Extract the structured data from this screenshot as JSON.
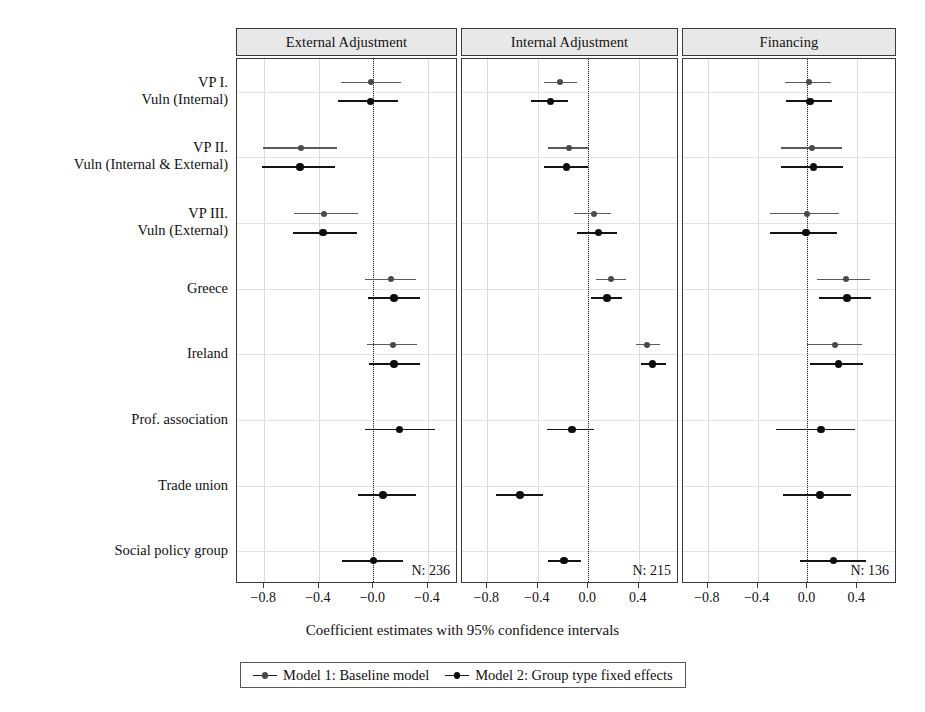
{
  "chart_data": {
    "type": "scatter",
    "subtype": "coefficient-forest-plot",
    "title": "",
    "xlabel": "Coefficient estimates with 95% confidence intervals",
    "ylabel": "",
    "grid": true,
    "legend_position": "bottom",
    "zero_reference_line": 0.0,
    "categories": [
      "VP I.\nVuln (Internal)",
      "VP II.\nVuln (Internal & External)",
      "VP III.\nVuln (External)",
      "Greece",
      "Ireland",
      "Prof. association",
      "Trade union",
      "Social policy group"
    ],
    "row_labels": [
      [
        "VP I.",
        "Vuln (Internal)"
      ],
      [
        "VP II.",
        "Vuln (Internal & External)"
      ],
      [
        "VP III.",
        "Vuln (External)"
      ],
      [
        "Greece"
      ],
      [
        "Ireland"
      ],
      [
        "Prof. association"
      ],
      [
        "Trade union"
      ],
      [
        "Social policy group"
      ]
    ],
    "series": [
      {
        "name": "Model 1: Baseline model",
        "key": "m1",
        "color": "#4a4a4a"
      },
      {
        "name": "Model 2: Group type fixed effects",
        "key": "m2",
        "color": "#0d0d0d"
      }
    ],
    "panels": [
      {
        "id": "external-adjustment",
        "label": "External Adjustment",
        "n_label": "N: 236",
        "n": 236,
        "xlim": [
          -1.0,
          0.62
        ],
        "xticks": [
          -0.8,
          -0.4,
          0.0,
          0.4
        ],
        "xticklabels": [
          "−0.8",
          "−0.4",
          "−0.0",
          "−0.4"
        ],
        "estimates": [
          {
            "row": "VP I. Vuln (Internal)",
            "m1": {
              "est": -0.02,
              "lo": -0.24,
              "hi": 0.2
            },
            "m2": {
              "est": -0.02,
              "lo": -0.26,
              "hi": 0.18
            }
          },
          {
            "row": "VP II. Vuln (Internal & External)",
            "m1": {
              "est": -0.53,
              "lo": -0.81,
              "hi": -0.27
            },
            "m2": {
              "est": -0.54,
              "lo": -0.82,
              "hi": -0.28
            }
          },
          {
            "row": "VP III. Vuln (External)",
            "m1": {
              "est": -0.36,
              "lo": -0.58,
              "hi": -0.11
            },
            "m2": {
              "est": -0.37,
              "lo": -0.59,
              "hi": -0.12
            }
          },
          {
            "row": "Greece",
            "m1": {
              "est": 0.13,
              "lo": -0.06,
              "hi": 0.31
            },
            "m2": {
              "est": 0.15,
              "lo": -0.04,
              "hi": 0.34
            }
          },
          {
            "row": "Ireland",
            "m1": {
              "est": 0.14,
              "lo": -0.05,
              "hi": 0.32
            },
            "m2": {
              "est": 0.15,
              "lo": -0.03,
              "hi": 0.34
            }
          },
          {
            "row": "Prof. association",
            "m1": null,
            "m2": {
              "est": 0.19,
              "lo": -0.06,
              "hi": 0.45
            }
          },
          {
            "row": "Trade union",
            "m1": null,
            "m2": {
              "est": 0.07,
              "lo": -0.11,
              "hi": 0.31
            }
          },
          {
            "row": "Social policy group",
            "m1": null,
            "m2": {
              "est": 0.0,
              "lo": -0.23,
              "hi": 0.22
            }
          }
        ]
      },
      {
        "id": "internal-adjustment",
        "label": "Internal Adjustment",
        "n_label": "N: 215",
        "n": 215,
        "xlim": [
          -1.0,
          0.72
        ],
        "xticks": [
          -0.8,
          -0.4,
          0.0,
          0.4
        ],
        "xticklabels": [
          "−0.8",
          "−0.4",
          "0.0",
          "0.4"
        ],
        "estimates": [
          {
            "row": "VP I. Vuln (Internal)",
            "m1": {
              "est": -0.22,
              "lo": -0.35,
              "hi": -0.09
            },
            "m2": {
              "est": -0.3,
              "lo": -0.45,
              "hi": -0.16
            }
          },
          {
            "row": "VP II. Vuln (Internal & External)",
            "m1": {
              "est": -0.15,
              "lo": -0.32,
              "hi": 0.01
            },
            "m2": {
              "est": -0.17,
              "lo": -0.35,
              "hi": 0.0
            }
          },
          {
            "row": "VP III. Vuln (External)",
            "m1": {
              "est": 0.05,
              "lo": -0.11,
              "hi": 0.18
            },
            "m2": {
              "est": 0.08,
              "lo": -0.09,
              "hi": 0.23
            }
          },
          {
            "row": "Greece",
            "m1": {
              "est": 0.18,
              "lo": 0.06,
              "hi": 0.3
            },
            "m2": {
              "est": 0.15,
              "lo": 0.02,
              "hi": 0.27
            }
          },
          {
            "row": "Ireland",
            "m1": {
              "est": 0.47,
              "lo": 0.38,
              "hi": 0.57
            },
            "m2": {
              "est": 0.51,
              "lo": 0.42,
              "hi": 0.62
            }
          },
          {
            "row": "Prof. association",
            "m1": null,
            "m2": {
              "est": -0.13,
              "lo": -0.33,
              "hi": 0.05
            }
          },
          {
            "row": "Trade union",
            "m1": null,
            "m2": {
              "est": -0.54,
              "lo": -0.73,
              "hi": -0.36
            }
          },
          {
            "row": "Social policy group",
            "m1": null,
            "m2": {
              "est": -0.19,
              "lo": -0.32,
              "hi": -0.06
            }
          }
        ]
      },
      {
        "id": "financing",
        "label": "Financing",
        "n_label": "N: 136",
        "n": 136,
        "xlim": [
          -1.0,
          0.72
        ],
        "xticks": [
          -0.8,
          -0.4,
          0.0,
          0.4
        ],
        "xticklabels": [
          "−0.8",
          "−0.4",
          "0.0",
          "0.4"
        ],
        "estimates": [
          {
            "row": "VP I. Vuln (Internal)",
            "m1": {
              "est": 0.01,
              "lo": -0.18,
              "hi": 0.19
            },
            "m2": {
              "est": 0.02,
              "lo": -0.17,
              "hi": 0.2
            }
          },
          {
            "row": "VP II. Vuln (Internal & External)",
            "m1": {
              "est": 0.04,
              "lo": -0.21,
              "hi": 0.28
            },
            "m2": {
              "est": 0.05,
              "lo": -0.21,
              "hi": 0.29
            }
          },
          {
            "row": "VP III. Vuln (External)",
            "m1": {
              "est": 0.0,
              "lo": -0.3,
              "hi": 0.25
            },
            "m2": {
              "est": -0.01,
              "lo": -0.3,
              "hi": 0.24
            }
          },
          {
            "row": "Greece",
            "m1": {
              "est": 0.31,
              "lo": 0.08,
              "hi": 0.5
            },
            "m2": {
              "est": 0.32,
              "lo": 0.09,
              "hi": 0.51
            }
          },
          {
            "row": "Ireland",
            "m1": {
              "est": 0.22,
              "lo": 0.0,
              "hi": 0.44
            },
            "m2": {
              "est": 0.25,
              "lo": 0.02,
              "hi": 0.45
            }
          },
          {
            "row": "Prof. association",
            "m1": null,
            "m2": {
              "est": 0.11,
              "lo": -0.25,
              "hi": 0.38
            }
          },
          {
            "row": "Trade union",
            "m1": null,
            "m2": {
              "est": 0.1,
              "lo": -0.2,
              "hi": 0.35
            }
          },
          {
            "row": "Social policy group",
            "m1": null,
            "m2": {
              "est": 0.21,
              "lo": -0.06,
              "hi": 0.47
            }
          }
        ]
      }
    ]
  }
}
